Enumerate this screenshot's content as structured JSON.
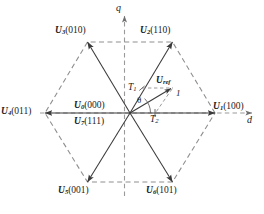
{
  "figure": {
    "type": "vector-diagram",
    "background_color": "#ffffff",
    "line_color": "#3a3a3a",
    "dashed_color": "#8a8a8a",
    "text_color": "#1a1a1a"
  },
  "axes": {
    "horizontal": {
      "label": "d",
      "arrow": "right"
    },
    "vertical": {
      "label": "q",
      "arrow": "up"
    }
  },
  "vectors": [
    {
      "name": "U",
      "index": "1",
      "state": "(100)",
      "label": "U1(100)",
      "angle_deg": 0,
      "style": "solid-arrow"
    },
    {
      "name": "U",
      "index": "2",
      "state": "(110)",
      "label": "U2(110)",
      "angle_deg": 60,
      "style": "solid-arrow"
    },
    {
      "name": "U",
      "index": "3",
      "state": "(010)",
      "label": "U3(010)",
      "angle_deg": 120,
      "style": "solid-arrow"
    },
    {
      "name": "U",
      "index": "4",
      "state": "(011)",
      "label": "U4(011)",
      "angle_deg": 180,
      "style": "solid-arrow"
    },
    {
      "name": "U",
      "index": "5",
      "state": "(001)",
      "label": "U5(001)",
      "angle_deg": 240,
      "style": "solid-arrow"
    },
    {
      "name": "U",
      "index": "6",
      "state": "(101)",
      "label": "U6(101)",
      "angle_deg": 300,
      "style": "solid-arrow"
    }
  ],
  "zero_vectors": [
    {
      "name": "U",
      "index": "0",
      "state": "(000)",
      "label": "U0(000)"
    },
    {
      "name": "U",
      "index": "7",
      "state": "(111)",
      "label": "U7(111)"
    }
  ],
  "reference": {
    "name": "U",
    "subscript": "ref",
    "label": "Uref",
    "point_label": "1",
    "angle_symbol": "θ"
  },
  "components": [
    {
      "label": "T",
      "subscript": "1",
      "full": "T1"
    },
    {
      "label": "T",
      "subscript": "2",
      "full": "T2"
    }
  ],
  "geometry": {
    "center": {
      "x": 130,
      "y": 113
    },
    "radius": 85,
    "vertices": [
      {
        "x": 215,
        "y": 113
      },
      {
        "x": 172.5,
        "y": 42
      },
      {
        "x": 87.5,
        "y": 42
      },
      {
        "x": 45,
        "y": 113
      },
      {
        "x": 87.5,
        "y": 182
      },
      {
        "x": 172.5,
        "y": 182
      }
    ],
    "ref_tip": {
      "x": 172,
      "y": 88
    },
    "t2_foot": {
      "x": 155,
      "y": 113
    },
    "t1_foot": {
      "x": 142,
      "y": 88
    }
  }
}
